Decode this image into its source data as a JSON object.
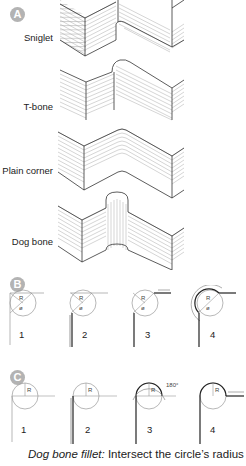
{
  "figure": {
    "section_a": {
      "badge": "A",
      "labels": [
        "Sniglet",
        "T-bone",
        "Plain corner",
        "Dog bone"
      ]
    },
    "section_b": {
      "badge": "B",
      "steps": [
        "1",
        "2",
        "3",
        "4"
      ],
      "radius_label": "R",
      "diameter_label": "ø",
      "angle_label": "180°"
    },
    "section_c": {
      "badge": "C",
      "steps": [
        "1",
        "2",
        "3",
        "4"
      ],
      "radius_label": "R",
      "angle_label": "180°"
    },
    "caption": {
      "italic": "Dog bone fillet:",
      "text": " Intersect the circle’s radius"
    }
  }
}
